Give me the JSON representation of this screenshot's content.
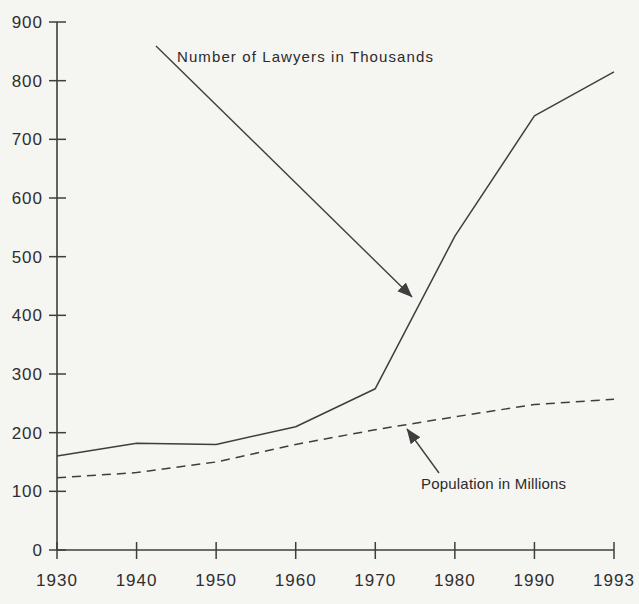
{
  "figure": {
    "background_color": "#f5f5f2",
    "ink_color": "#3e3e3e",
    "text_color": "#2b2b2b"
  },
  "chart_data": {
    "type": "line",
    "title": "",
    "xlabel": "",
    "ylabel": "",
    "categories": [
      "1930",
      "1940",
      "1950",
      "1960",
      "1970",
      "1980",
      "1990",
      "1993"
    ],
    "series": [
      {
        "name": "Number of Lawyers in Thousands",
        "line_style": "solid",
        "values": [
          160,
          182,
          180,
          210,
          275,
          535,
          740,
          815
        ]
      },
      {
        "name": "Population in Millions",
        "line_style": "dashed",
        "values": [
          123,
          132,
          150,
          180,
          205,
          227,
          248,
          257
        ]
      }
    ],
    "ylim": [
      0,
      900
    ],
    "ytick_step": 100,
    "ytick_labels": [
      "0",
      "100",
      "200",
      "300",
      "400",
      "500",
      "600",
      "700",
      "800",
      "900"
    ],
    "grid": false,
    "legend": "arrow-annotations"
  },
  "annotations": [
    {
      "text": "Number of Lawyers in Thousands",
      "points_to": "solid line"
    },
    {
      "text": "Population in Millions",
      "points_to": "dashed line"
    }
  ]
}
